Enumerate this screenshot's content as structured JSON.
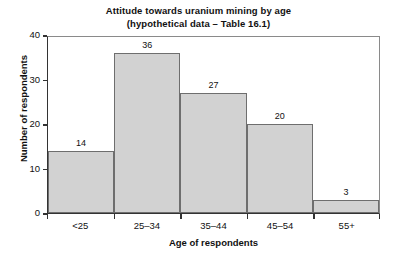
{
  "chart_data": {
    "type": "bar",
    "title": "Attitude towards uranium mining by age",
    "subtitle": "(hypothetical data – Table 16.1)",
    "title_lines": [
      "Attitude towards uranium mining by age",
      "(hypothetical data – Table 16.1)"
    ],
    "xlabel": "Age of respondents",
    "ylabel": "Number of respondents",
    "categories": [
      "<25",
      "25–34",
      "35–44",
      "45–54",
      "55+"
    ],
    "values": [
      14,
      36,
      27,
      20,
      3
    ],
    "value_labels": [
      "14",
      "36",
      "27",
      "20",
      "3"
    ],
    "ylim": [
      0,
      40
    ],
    "yticks": [
      0,
      10,
      20,
      30,
      40
    ],
    "ytick_labels": [
      "0",
      "10",
      "20",
      "30",
      "40"
    ],
    "grid": false,
    "legend": false,
    "bar_style": "histogram-contiguous",
    "colors": {
      "bar_fill": "#d2d2d2",
      "bar_border": "#6e6e6e",
      "axis": "#333333",
      "frame": "#8a8a8a",
      "text": "#111111",
      "background": "#ffffff"
    }
  }
}
